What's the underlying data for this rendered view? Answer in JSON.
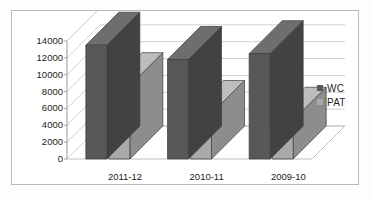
{
  "chart_data": {
    "type": "bar",
    "title": "",
    "subtitle": "",
    "xlabel": "",
    "ylabel": "",
    "categories": [
      "2011-12",
      "2010-11",
      "2009-10"
    ],
    "series": [
      {
        "name": "WC",
        "values": [
          13500,
          11800,
          12500
        ],
        "color": "#585858"
      },
      {
        "name": "PAT",
        "values": [
          8700,
          5400,
          4600
        ],
        "color": "#a9a9a9"
      }
    ],
    "ylim": [
      0,
      14000
    ],
    "ytick_step": 2000,
    "yticks": [
      "14000",
      "12000",
      "10000",
      "8000",
      "6000",
      "4000",
      "2000",
      "0"
    ],
    "ytick_values": [
      14000,
      12000,
      10000,
      8000,
      6000,
      4000,
      2000,
      0
    ],
    "grid": true,
    "grid_axis": "y",
    "legend": true,
    "legend_position": "right",
    "three_d": true
  },
  "legend": {
    "items": [
      {
        "label": "WC",
        "color": "#585858"
      },
      {
        "label": "PAT",
        "color": "#a9a9a9"
      }
    ]
  },
  "axes": {
    "y_labels": [
      "14000",
      "12000",
      "10000",
      "8000",
      "6000",
      "4000",
      "2000",
      "0"
    ],
    "x_labels": [
      "2011-12",
      "2010-11",
      "2009-10"
    ]
  },
  "style": {
    "plot_background": "#ffffff",
    "frame_border": "#b9b9b9",
    "gridline_color": "#c4c4c4",
    "wall_color": "#ffffff",
    "floor_color": "#ffffff",
    "series_wc": "#585858",
    "series_wc_side": "#424242",
    "series_wc_top": "#6e6e6e",
    "series_pat": "#a9a9a9",
    "series_pat_side": "#8d8d8d",
    "series_pat_top": "#bdbdbd",
    "text_color": "#1d1d1d"
  }
}
